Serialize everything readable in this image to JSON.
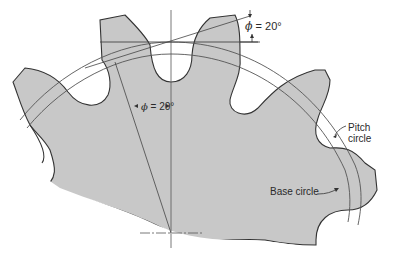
{
  "figure": {
    "type": "gear-tooth-geometry",
    "colors": {
      "gear_fill": "#c8c8c8",
      "gear_outline": "#333333",
      "construction_line": "#555555",
      "background": "#ffffff"
    }
  },
  "labels": {
    "pressure_angle_top": {
      "symbol": "ϕ",
      "value": "= 20°"
    },
    "pressure_angle_mid": {
      "symbol": "ϕ",
      "value": "= 20°"
    },
    "pitch_circle": {
      "line1": "Pitch",
      "line2": "circle"
    },
    "base_circle": "Base circle"
  }
}
